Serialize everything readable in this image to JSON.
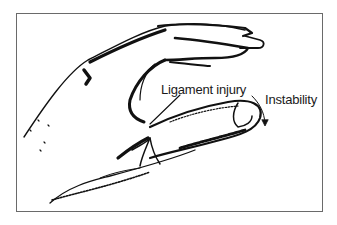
{
  "figure": {
    "labels": {
      "ligament": "Ligament injury",
      "instability": "Instability"
    }
  }
}
